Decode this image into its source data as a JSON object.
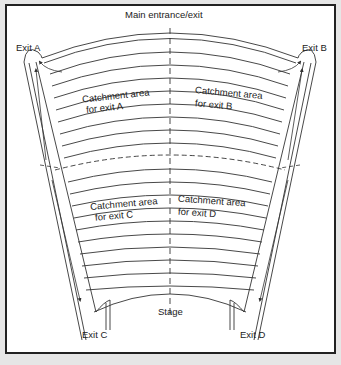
{
  "diagram": {
    "title": "Main entrance/exit",
    "stage_label": "Stage",
    "exits": {
      "a": "Exit A",
      "b": "Exit B",
      "c": "Exit C",
      "d": "Exit D"
    },
    "catchments": {
      "a": {
        "line1": "Catchment area",
        "line2": "for exit A"
      },
      "b": {
        "line1": "Catchment area",
        "line2": "for exit B"
      },
      "c": {
        "line1": "Catchment area",
        "line2": "for exit C"
      },
      "d": {
        "line1": "Catchment area",
        "line2": "for exit D"
      }
    },
    "colors": {
      "line": "#333333",
      "background": "#ffffff",
      "outer": "#e6e6e6"
    }
  }
}
